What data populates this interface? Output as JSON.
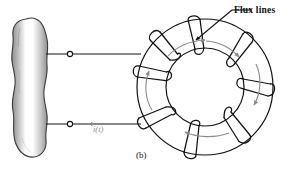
{
  "figure": {
    "caption": "(b)",
    "labels": {
      "flux_lines": "Flux lines",
      "current": "i(t)"
    },
    "colors": {
      "ink": "#111111",
      "flux_arrow": "#8a8a8a",
      "lead_arrow": "#8a8a8a",
      "blob_outline": "#3a3a3a",
      "background": "#ffffff"
    },
    "icons": {
      "terminal_top": "terminal-dot-icon",
      "terminal_bottom": "terminal-dot-icon",
      "current_arrow": "current-direction-arrow-icon",
      "flux_arrow_top": "flux-arrow-icon",
      "flux_arrow_left": "flux-arrow-icon",
      "flux_arrow_right": "flux-arrow-icon",
      "flux_arrow_bottom": "flux-arrow-icon"
    },
    "components": {
      "source": "irregular-blob-source",
      "core": "toroidal-core",
      "winding_turns": 8,
      "leads": 2
    }
  }
}
